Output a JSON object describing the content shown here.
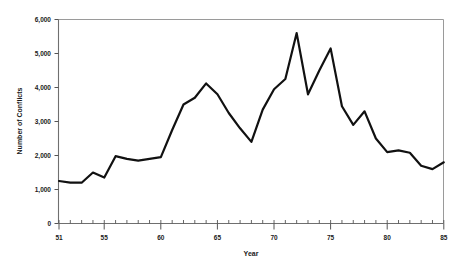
{
  "chart_data": {
    "type": "line",
    "title": "",
    "subtitle": "",
    "xlabel": "Year",
    "ylabel": "Number of Conflicts",
    "xlim": [
      51,
      85
    ],
    "ylim": [
      0,
      6000
    ],
    "grid": false,
    "legend": false,
    "legend_position": "none",
    "xtick_labels": [
      "51",
      "55",
      "60",
      "65",
      "70",
      "75",
      "80",
      "85"
    ],
    "xtick_values": [
      51,
      55,
      60,
      65,
      70,
      75,
      80,
      85
    ],
    "ytick_labels": [
      "0",
      "1,000",
      "2,000",
      "3,000",
      "4,000",
      "5,000",
      "6,000"
    ],
    "ytick_values": [
      0,
      1000,
      2000,
      3000,
      4000,
      5000,
      6000
    ],
    "x_minor_ticks_every": 1,
    "series": [
      {
        "name": "Number of Conflicts",
        "color": "#111111",
        "line_width": 2.2,
        "x": [
          51,
          52,
          53,
          54,
          55,
          56,
          57,
          58,
          59,
          60,
          61,
          62,
          63,
          64,
          65,
          66,
          67,
          68,
          69,
          70,
          71,
          72,
          73,
          74,
          75,
          76,
          77,
          78,
          79,
          80,
          81,
          82,
          83,
          84,
          85
        ],
        "values": [
          1250,
          1200,
          1200,
          1500,
          1350,
          1980,
          1900,
          1850,
          1900,
          1950,
          2750,
          3500,
          3700,
          4120,
          3800,
          3250,
          2800,
          2400,
          3350,
          3950,
          4250,
          5600,
          3800,
          4500,
          5150,
          3450,
          2900,
          3300,
          2500,
          2100,
          2150,
          2080,
          1700,
          1600,
          1800
        ]
      }
    ],
    "annotations": []
  },
  "axes": {
    "x_axis_title": "Year",
    "y_axis_title": "Number of Conflicts",
    "frame_color": "#9a9a9a",
    "tick_color": "#555555"
  }
}
